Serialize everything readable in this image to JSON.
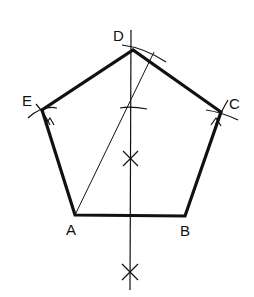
{
  "diagram": {
    "vertices": [
      {
        "id": "A",
        "label": "A",
        "x": 75,
        "y": 215,
        "lx": 66,
        "ly": 222
      },
      {
        "id": "B",
        "label": "B",
        "x": 185,
        "y": 216,
        "lx": 180,
        "ly": 223
      },
      {
        "id": "C",
        "label": "C",
        "x": 221,
        "y": 112,
        "lx": 229,
        "ly": 96
      },
      {
        "id": "D",
        "label": "D",
        "x": 133,
        "y": 50,
        "lx": 113,
        "ly": 28
      },
      {
        "id": "E",
        "label": "E",
        "x": 42,
        "y": 110,
        "lx": 22,
        "ly": 93
      }
    ],
    "colors": {
      "line": "#111111",
      "background": "#ffffff"
    }
  }
}
